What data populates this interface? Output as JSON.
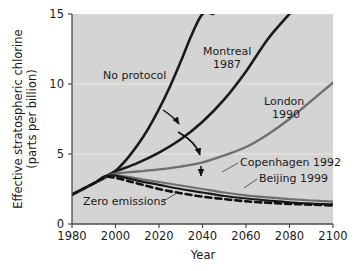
{
  "chart_data": {
    "type": "line",
    "title": "",
    "xlabel": "Year",
    "ylabel_line1": "Effective stratospheric chlorine",
    "ylabel_line2": "(parts per billion)",
    "xlim": [
      1980,
      2100
    ],
    "ylim": [
      0,
      15
    ],
    "xticks": [
      1980,
      2000,
      2020,
      2040,
      2060,
      2080,
      2100
    ],
    "xtick_labels": [
      "1980",
      "2000",
      "2020",
      "2040",
      "2060",
      "2080",
      "2100"
    ],
    "yticks": [
      0,
      5,
      10,
      15
    ],
    "ytick_labels": [
      "0",
      "5",
      "10",
      "15"
    ],
    "grid": "horizontal-white-faint",
    "legend_position": "inline-annotations",
    "plot_background": "#d4d4d4",
    "series": [
      {
        "name": "No protocol",
        "color": "#1a1a1a",
        "width": 2.6,
        "dash": "none",
        "x": [
          1980,
          1985,
          1990,
          1995,
          2000,
          2005,
          2010,
          2015,
          2020,
          2025,
          2030,
          2035,
          2040,
          2045
        ],
        "values": [
          2.1,
          2.5,
          2.9,
          3.3,
          3.8,
          4.6,
          5.6,
          6.8,
          8.2,
          9.8,
          11.6,
          13.5,
          15.0,
          15.0
        ]
      },
      {
        "name": "Montreal 1987",
        "color": "#1a1a1a",
        "width": 2.6,
        "dash": "none",
        "x": [
          1980,
          1990,
          1995,
          2000,
          2010,
          2020,
          2030,
          2040,
          2050,
          2060,
          2070,
          2080
        ],
        "values": [
          2.1,
          2.9,
          3.35,
          3.75,
          4.35,
          5.1,
          6.05,
          7.3,
          8.9,
          10.9,
          13.2,
          15.0
        ]
      },
      {
        "name": "London 1990",
        "color": "#6e6e6e",
        "width": 2.4,
        "dash": "none",
        "x": [
          1980,
          1990,
          1995,
          2000,
          2010,
          2020,
          2030,
          2040,
          2050,
          2060,
          2070,
          2080,
          2090,
          2100
        ],
        "values": [
          2.1,
          2.9,
          3.35,
          3.6,
          3.75,
          3.9,
          4.1,
          4.4,
          4.9,
          5.5,
          6.4,
          7.5,
          8.8,
          10.1
        ]
      },
      {
        "name": "Copenhagen 1992",
        "color": "#6e6e6e",
        "width": 2.2,
        "dash": "none",
        "x": [
          1980,
          1990,
          1995,
          2000,
          2010,
          2020,
          2030,
          2040,
          2050,
          2060,
          2070,
          2080,
          2090,
          2100
        ],
        "values": [
          2.1,
          2.9,
          3.4,
          3.5,
          3.25,
          3.0,
          2.75,
          2.5,
          2.25,
          2.05,
          1.9,
          1.78,
          1.68,
          1.6
        ]
      },
      {
        "name": "Beijing 1999",
        "color": "#1a1a1a",
        "width": 2.2,
        "dash": "none",
        "x": [
          1980,
          1990,
          1995,
          2000,
          2010,
          2020,
          2030,
          2040,
          2050,
          2060,
          2070,
          2080,
          2090,
          2100
        ],
        "values": [
          2.1,
          2.9,
          3.4,
          3.45,
          3.1,
          2.8,
          2.5,
          2.25,
          2.0,
          1.82,
          1.68,
          1.55,
          1.46,
          1.4
        ]
      },
      {
        "name": "Zero emissions",
        "color": "#111111",
        "width": 2.6,
        "dash": "6 4",
        "x": [
          1980,
          1990,
          1995,
          2000,
          2005,
          2010,
          2020,
          2030,
          2040,
          2050,
          2060,
          2070,
          2080,
          2090,
          2100
        ],
        "values": [
          2.1,
          2.9,
          3.35,
          3.3,
          3.1,
          2.9,
          2.5,
          2.2,
          1.95,
          1.78,
          1.62,
          1.52,
          1.44,
          1.38,
          1.32
        ]
      }
    ],
    "annotations": [
      {
        "id": "no-protocol",
        "text": "No protocol",
        "x": 103,
        "y": 79,
        "anchor": "start"
      },
      {
        "id": "montreal",
        "text": "Montreal",
        "x": 203,
        "y": 55,
        "anchor": "start"
      },
      {
        "id": "montreal-year",
        "text": "1987",
        "x": 213,
        "y": 68,
        "anchor": "start"
      },
      {
        "id": "london",
        "text": "London",
        "x": 264,
        "y": 105,
        "anchor": "start"
      },
      {
        "id": "london-year",
        "text": "1990",
        "x": 272,
        "y": 118,
        "anchor": "start"
      },
      {
        "id": "copenhagen",
        "text": "Copenhagen 1992",
        "x": 240,
        "y": 166,
        "anchor": "start"
      },
      {
        "id": "beijing",
        "text": "Beijing 1999",
        "x": 259,
        "y": 182,
        "anchor": "start"
      },
      {
        "id": "zero-emissions",
        "text": "Zero emissions",
        "x": 83,
        "y": 205,
        "anchor": "start"
      }
    ]
  }
}
